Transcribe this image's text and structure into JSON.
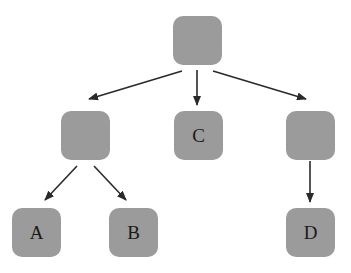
{
  "diagram": {
    "type": "tree",
    "node_fill": "#9b9b9b",
    "edge_color": "#2a2a2a",
    "nodes": [
      {
        "id": "root",
        "label": "",
        "x": 173,
        "y": 16
      },
      {
        "id": "left",
        "label": "",
        "x": 61,
        "y": 111
      },
      {
        "id": "c",
        "label": "C",
        "x": 174,
        "y": 111
      },
      {
        "id": "right",
        "label": "",
        "x": 286,
        "y": 111
      },
      {
        "id": "a",
        "label": "A",
        "x": 12,
        "y": 208
      },
      {
        "id": "b",
        "label": "B",
        "x": 109,
        "y": 208
      },
      {
        "id": "d",
        "label": "D",
        "x": 286,
        "y": 208
      }
    ],
    "edges": [
      {
        "from": "root",
        "to": "left"
      },
      {
        "from": "root",
        "to": "c"
      },
      {
        "from": "root",
        "to": "right"
      },
      {
        "from": "left",
        "to": "a"
      },
      {
        "from": "left",
        "to": "b"
      },
      {
        "from": "right",
        "to": "d"
      }
    ]
  }
}
